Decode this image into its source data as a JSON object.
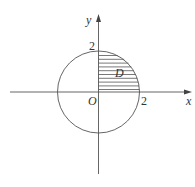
{
  "diagram": {
    "type": "coordinate-plane",
    "axes": {
      "x_label": "x",
      "y_label": "y",
      "origin_label": "O"
    },
    "ticks": {
      "x_tick_label": "2",
      "y_tick_label": "2"
    },
    "region": {
      "label": "D",
      "fill": "horizontal-hatch",
      "bounds": "x ≥ 0, y ≥ 0, x² + y² ≤ 4"
    },
    "colors": {
      "stroke": "#555555",
      "text": "#333333",
      "background": "#ffffff"
    }
  }
}
